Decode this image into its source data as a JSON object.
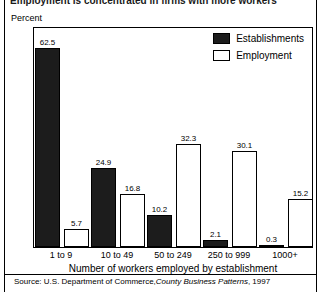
{
  "figure": {
    "title_clipped": "Employment is concentrated in firms with more workers",
    "unit_label": "Percent",
    "xaxis_title": "Number of workers employed by establishment",
    "source_prefix": "Source: U.S. Department of Commerce,",
    "source_italic": "County Business Patterns",
    "source_suffix": ", 1997"
  },
  "legend": {
    "position": "top-right",
    "entries": [
      {
        "label": "Establishments",
        "swatch": "dark-filled-square",
        "color": "#1c1c1c"
      },
      {
        "label": "Employment",
        "swatch": "white-outlined-square",
        "color": "#ffffff"
      }
    ]
  },
  "chart_data": {
    "type": "bar",
    "title": "Employment is concentrated in firms with more workers",
    "xlabel": "Number of workers employed by establishment",
    "ylabel": "Percent",
    "ylim": [
      0,
      70
    ],
    "grid": false,
    "legend_position": "top-right",
    "categories": [
      "1 to 9",
      "10 to 49",
      "50 to 249",
      "250 to 999",
      "1000+"
    ],
    "series": [
      {
        "name": "Establishments",
        "color": "#1c1c1c",
        "values": [
          62.5,
          24.9,
          10.2,
          2.1,
          0.3
        ],
        "labels": [
          "62.5",
          "24.9",
          "10.2",
          "2.1",
          "0.3"
        ]
      },
      {
        "name": "Employment",
        "color": "#ffffff",
        "values": [
          5.7,
          16.8,
          32.3,
          30.1,
          15.2
        ],
        "labels": [
          "5.7",
          "16.8",
          "32.3",
          "30.1",
          "15.2"
        ]
      }
    ]
  }
}
